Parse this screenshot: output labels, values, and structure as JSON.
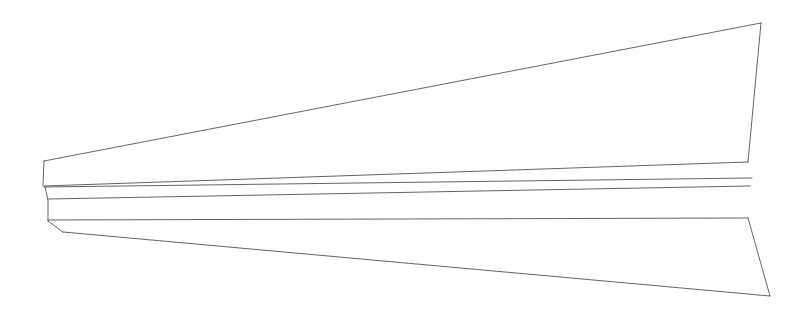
{
  "figure": {
    "background_color": "#ffffff",
    "stroke_color": "#3a3a3a",
    "stroke_width": 0.9,
    "width": 806,
    "height": 321
  },
  "chart_data": {
    "type": "line",
    "subtitle": "",
    "xlabel": "",
    "ylabel": "",
    "xlim": [
      0,
      806
    ],
    "ylim": [
      0,
      321
    ],
    "grid": false,
    "legend": null,
    "annotations": [],
    "tick_labels": {
      "x": [],
      "y": []
    },
    "series": [
      {
        "name": "upper-leading-edge",
        "closed": false,
        "points": [
          [
            44,
            161
          ],
          [
            761,
            23
          ]
        ]
      },
      {
        "name": "wing-tip-trailing-edge",
        "closed": false,
        "points": [
          [
            761,
            23
          ],
          [
            748,
            162
          ]
        ]
      },
      {
        "name": "upper-surface-inboard-trailing-edge",
        "closed": false,
        "points": [
          [
            748,
            162
          ],
          [
            44,
            186
          ]
        ]
      },
      {
        "name": "nose-upper-vertical",
        "closed": false,
        "points": [
          [
            44,
            161
          ],
          [
            43,
            186
          ]
        ]
      },
      {
        "name": "fuselage-upper-chord-line",
        "closed": false,
        "points": [
          [
            44,
            187
          ],
          [
            752,
            178
          ]
        ]
      },
      {
        "name": "fuselage-lower-chord-line",
        "closed": false,
        "points": [
          [
            49,
            199
          ],
          [
            750,
            186
          ]
        ]
      },
      {
        "name": "nose-mid-vertical",
        "closed": false,
        "points": [
          [
            45,
            187
          ],
          [
            48,
            200
          ]
        ]
      },
      {
        "name": "body-side-vertical",
        "closed": false,
        "points": [
          [
            48,
            200
          ],
          [
            48,
            221
          ]
        ]
      },
      {
        "name": "lower-body-horizontal",
        "closed": false,
        "points": [
          [
            48,
            220
          ],
          [
            748,
            218
          ]
        ]
      },
      {
        "name": "nose-lower-chamfer",
        "closed": false,
        "points": [
          [
            48,
            221
          ],
          [
            63,
            232
          ]
        ]
      },
      {
        "name": "lower-leading-edge",
        "closed": false,
        "points": [
          [
            63,
            232
          ],
          [
            770,
            296
          ]
        ]
      },
      {
        "name": "lower-wing-tip-edge",
        "closed": false,
        "points": [
          [
            770,
            296
          ],
          [
            748,
            218
          ]
        ]
      }
    ]
  }
}
